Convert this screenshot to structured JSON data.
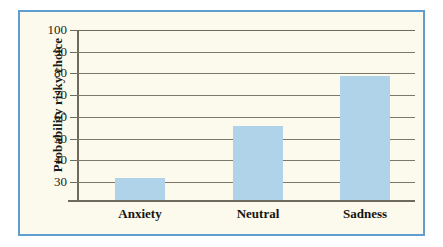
{
  "figure": {
    "background_color": "#ffffff",
    "panel_color": "#fbfaec",
    "border_color": "#5e9ed0",
    "bar_color": "#b1d3ea",
    "axis_color": "#6e6b5c"
  },
  "chart_data": {
    "type": "bar",
    "title": "",
    "subtitle": "",
    "xlabel": "",
    "ylabel": "Probability risky choice",
    "categories": [
      "Anxiety",
      "Neutral",
      "Sadness"
    ],
    "values": [
      32,
      56,
      79
    ],
    "series": [
      {
        "name": "Probability risky choice",
        "values": [
          32,
          56,
          79
        ]
      }
    ],
    "ylim": [
      22,
      100
    ],
    "yticks": [
      30,
      40,
      50,
      60,
      70,
      80,
      90,
      100
    ],
    "ytick_labels": [
      "30",
      "40",
      "50",
      "60",
      "70",
      "80",
      "90",
      "100"
    ],
    "grid": true,
    "grid_axis": "y",
    "legend": false,
    "legend_position": "none",
    "annotations": []
  }
}
